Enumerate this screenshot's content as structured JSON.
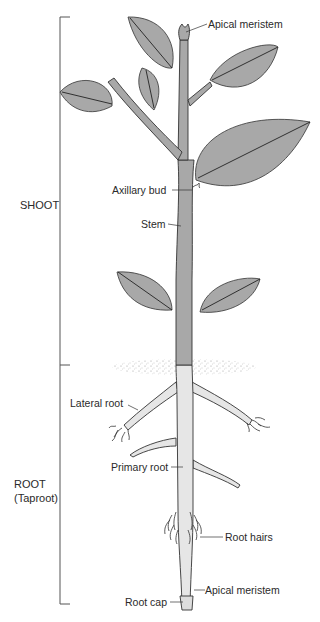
{
  "diagram": {
    "type": "plant-anatomy",
    "colors": {
      "shoot_fill": "#a8a8a8",
      "root_fill": "#e6e6e6",
      "outline": "#333333",
      "soil_stipple": "#9a9a9a",
      "bracket": "#555555",
      "text": "#2a2a2a"
    },
    "sections": {
      "shoot": {
        "label": "SHOOT"
      },
      "root": {
        "label_line1": "ROOT",
        "label_line2": "(Taproot)"
      }
    },
    "labels": {
      "apical_meristem_shoot": "Apical meristem",
      "axillary_bud": "Axillary bud",
      "stem": "Stem",
      "lateral_root": "Lateral root",
      "primary_root": "Primary root",
      "root_hairs": "Root hairs",
      "apical_meristem_root": "Apical meristem",
      "root_cap": "Root cap"
    }
  }
}
